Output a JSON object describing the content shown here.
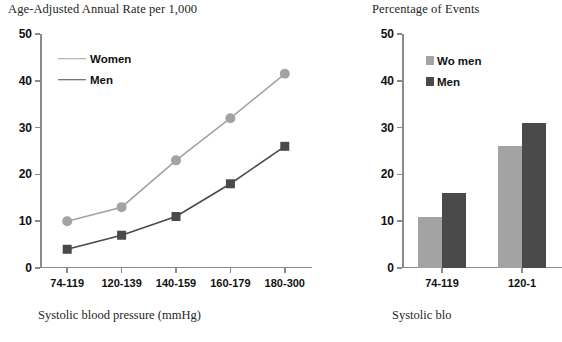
{
  "figure": {
    "background_color": "#ffffff",
    "women_color": "#a3a3a3",
    "men_color": "#4a4a4a",
    "axis_color": "#8a8a8a"
  },
  "left_panel": {
    "title": "Age-Adjusted Annual Rate per 1,000",
    "axis_caption": "Systolic blood pressure (mmHg)",
    "legend": [
      {
        "label": "Women",
        "marker": "circle-icon",
        "color": "#a3a3a3"
      },
      {
        "label": "Men",
        "marker": "square-icon",
        "color": "#4a4a4a"
      }
    ]
  },
  "right_panel": {
    "title": "Percentage of Events",
    "axis_caption": "Systolic blo",
    "legend": [
      {
        "label": "Wo men",
        "marker": "square-swatch-icon",
        "color": "#a3a3a3"
      },
      {
        "label": "Men",
        "marker": "square-swatch-icon",
        "color": "#4a4a4a"
      }
    ]
  },
  "chart_data": [
    {
      "type": "line",
      "title": "Age-Adjusted Annual Rate per 1,000",
      "xlabel": "Systolic blood pressure (mmHg)",
      "ylabel": "",
      "categories": [
        "74-119",
        "120-139",
        "140-159",
        "160-179",
        "180-300"
      ],
      "yticks": [
        0,
        10,
        20,
        30,
        40,
        50
      ],
      "ylim": [
        0,
        50
      ],
      "grid": false,
      "legend_position": "upper-left-inside",
      "series": [
        {
          "name": "Women",
          "color": "#a3a3a3",
          "marker": "circle",
          "values": [
            10,
            13,
            23,
            32,
            41.5
          ]
        },
        {
          "name": "Men",
          "color": "#4a4a4a",
          "marker": "square",
          "values": [
            4,
            7,
            11,
            18,
            26
          ]
        }
      ]
    },
    {
      "type": "bar",
      "title": "Percentage of Events",
      "xlabel": "Systolic blo",
      "ylabel": "",
      "categories": [
        "74-119",
        "120-1"
      ],
      "yticks": [
        0,
        10,
        20,
        30,
        40,
        50
      ],
      "ylim": [
        0,
        50
      ],
      "grid": false,
      "legend_position": "upper-right-inside",
      "note": "right chart is clipped at the image edge",
      "series": [
        {
          "name": "Wo men",
          "color": "#a3a3a3",
          "values": [
            11,
            26
          ]
        },
        {
          "name": "Men",
          "color": "#4a4a4a",
          "values": [
            16,
            31
          ]
        }
      ]
    }
  ]
}
